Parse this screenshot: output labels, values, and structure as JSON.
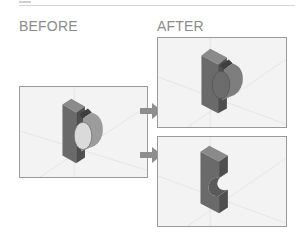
{
  "labels": {
    "before": "BEFORE",
    "after": "AFTER"
  },
  "panels": [
    {
      "id": "before",
      "description": "Block with cylindrical boss extruded from front face"
    },
    {
      "id": "after-top",
      "description": "Block with boss moved / extruded differently"
    },
    {
      "id": "after-bottom",
      "description": "Block with semicircular cut (cylinder subtracted)"
    }
  ],
  "colors": {
    "panel_bg": "#f3f3f3",
    "panel_border": "#9a9a9a",
    "arrow": "#8e8e8e",
    "label": "#8c8c8c",
    "block_front": "#6a6a6a",
    "block_top": "#8a8a8a",
    "block_side": "#4e4e4e"
  }
}
